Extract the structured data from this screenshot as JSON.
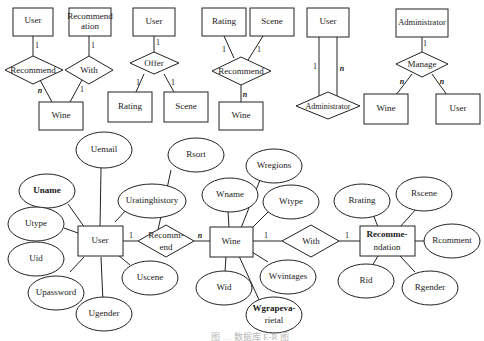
{
  "diagram": {
    "type": "er-diagram",
    "top_row": [
      {
        "id": "d1",
        "entities": [
          "User",
          "Recommend\nation",
          "Wine"
        ],
        "relationships": [
          "Recommend",
          "With"
        ],
        "cardinalities": [
          "1",
          "n",
          "1",
          "1"
        ]
      },
      {
        "id": "d2",
        "entities": [
          "User",
          "Rating",
          "Scene"
        ],
        "relationships": [
          "Offer"
        ],
        "cardinalities": [
          "1",
          "1",
          "1"
        ]
      },
      {
        "id": "d3",
        "entities": [
          "Rating",
          "Scene",
          "Wine"
        ],
        "relationships": [
          "Recommend"
        ],
        "cardinalities": [
          "1",
          "1",
          "n"
        ]
      },
      {
        "id": "d4",
        "entities": [
          "User"
        ],
        "relationships": [
          "Administrator"
        ],
        "cardinalities": [
          "1",
          "n"
        ]
      },
      {
        "id": "d5",
        "entities": [
          "Administrator",
          "Wine",
          "User"
        ],
        "relationships": [
          "Manage"
        ],
        "cardinalities": [
          "1",
          "n",
          "n"
        ]
      }
    ],
    "main": {
      "entities": {
        "user": "User",
        "wine": "Wine",
        "recommendation_l1": "Recomme-",
        "recommendation_l2": "ndation"
      },
      "relationships": {
        "recommend_l1": "Recomm-",
        "recommend_l2": "end",
        "with": "With"
      },
      "cardinalities": {
        "user_recommend": "1",
        "recommend_wine": "n",
        "wine_with": "1",
        "with_recommendation": "1"
      },
      "user_attributes": [
        "Uemail",
        "Uname",
        "Uratinghistory",
        "Utype",
        "Uid",
        "Upassword",
        "Ugender",
        "Uscene"
      ],
      "recommend_attributes": [
        "Rsort"
      ],
      "wine_attributes": [
        "Wname",
        "Wregions",
        "Wtype",
        "Wvintages",
        "Wid",
        "Wgrapeva-",
        "rietal"
      ],
      "recommendation_attributes": [
        "Rrating",
        "Rscene",
        "Rcomment",
        "Rid",
        "Rgender"
      ]
    },
    "labels": {
      "d1_user": "User",
      "d1_rec_l1": "Recommend",
      "d1_rec_l2": "ation",
      "d1_recommend": "Recommend",
      "d1_with": "With",
      "d1_wine": "Wine",
      "d2_user": "User",
      "d2_offer": "Offer",
      "d2_rating": "Rating",
      "d2_scene": "Scene",
      "d3_rating": "Rating",
      "d3_scene": "Scene",
      "d3_recommend": "Recommend",
      "d3_wine": "Wine",
      "d4_user": "User",
      "d4_admin": "Administrator",
      "d5_admin": "Administrator",
      "d5_manage": "Manage",
      "d5_wine": "Wine",
      "d5_user": "User",
      "one": "1",
      "many": "n"
    },
    "caption": "图 … 数据库 E-R 图"
  }
}
